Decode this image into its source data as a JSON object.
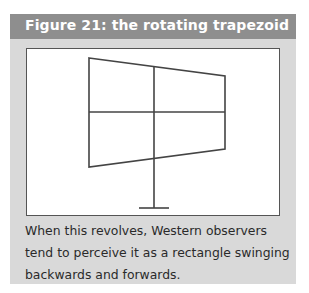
{
  "figure": {
    "title": "Figure 21: the rotating trapezoid",
    "caption": "When this revolves, Western observers tend to perceive it as a rectangle swinging backwards and forwards.",
    "colors": {
      "header_bg": "#8e8e8e",
      "box_bg": "#d9d9d9",
      "frame_bg": "#ffffff",
      "line": "#444444"
    },
    "diagram": {
      "shape": "trapezoid-window",
      "description": "Trapezoidal window divided into four panes by a vertical and a horizontal bar, mounted on a vertical stand with a horizontal base"
    }
  }
}
